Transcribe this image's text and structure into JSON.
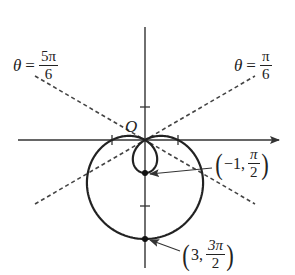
{
  "figure": {
    "origin_label": "O",
    "curve": {
      "equation": "r = 1 - 2 sin θ",
      "stroke": "#222222"
    },
    "axes": {
      "stroke": "#333333",
      "tick_unit_px": 33
    },
    "lines": [
      {
        "id": "theta-5pi-6",
        "theta_symbol": "θ",
        "eq": "=",
        "numerator": "5π",
        "denominator": "6",
        "style": "dashed"
      },
      {
        "id": "theta-pi-6",
        "theta_symbol": "θ",
        "eq": "=",
        "numerator": "π",
        "denominator": "6",
        "style": "dashed"
      }
    ],
    "points": [
      {
        "id": "inner",
        "r": "−1",
        "comma": ",",
        "theta_num": "π",
        "theta_den": "2",
        "open": "(",
        "close": ")"
      },
      {
        "id": "outer",
        "r": "3",
        "comma": ",",
        "theta_num": "3π",
        "theta_den": "2",
        "open": "(",
        "close": ")"
      }
    ]
  }
}
